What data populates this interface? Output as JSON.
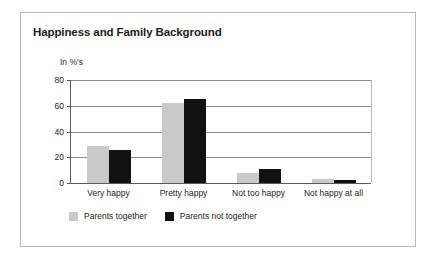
{
  "figure": {
    "title": "Happiness and Family Background",
    "border_color": "#b9b9b9",
    "background": "#ffffff"
  },
  "chart_data": {
    "type": "bar",
    "title": "Happiness and Family Background",
    "subtitle": "",
    "xlabel": "",
    "ylabel": "In %'s",
    "axis_unit_label": "In %'s",
    "categories": [
      "Very happy",
      "Pretty happy",
      "Not too happy",
      "Not happy at all"
    ],
    "series": [
      {
        "name": "Parents together",
        "color": "#c9c9c9",
        "values": [
          29,
          62,
          8,
          3
        ]
      },
      {
        "name": "Parents not together",
        "color": "#111111",
        "values": [
          26,
          65,
          11,
          2
        ]
      }
    ],
    "ylim": [
      0,
      80
    ],
    "yticks": [
      0,
      20,
      40,
      60,
      80
    ],
    "ytick_labels": [
      "0",
      "20",
      "40",
      "60",
      "80"
    ],
    "grid": true,
    "grid_axis": "y",
    "legend_position": "bottom-left",
    "grouped": true
  }
}
